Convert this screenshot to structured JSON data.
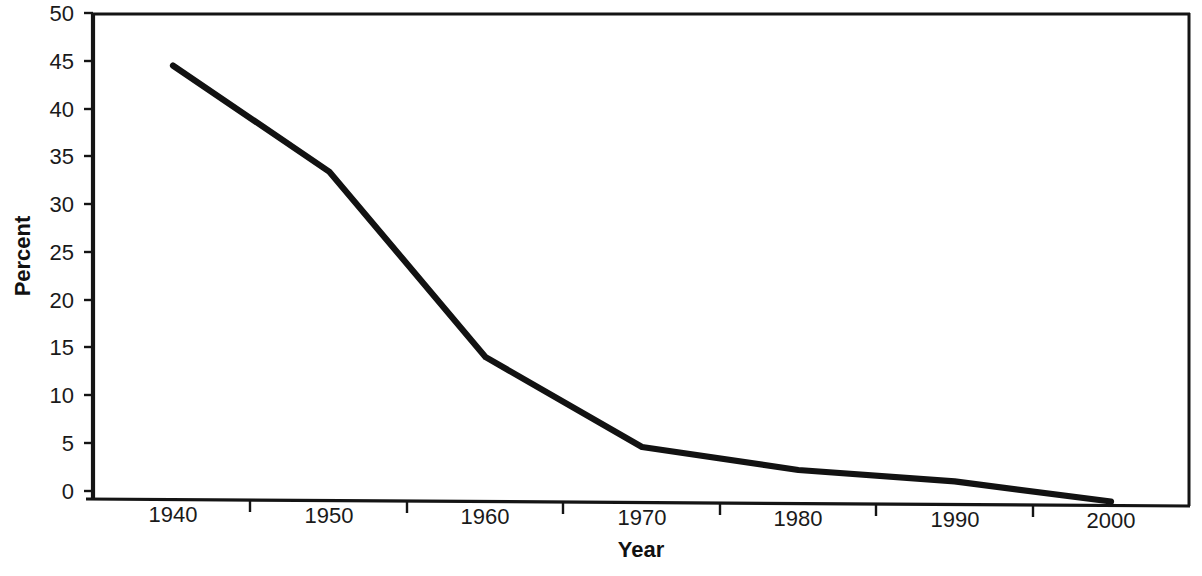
{
  "chart_data": {
    "type": "line",
    "title": "",
    "xlabel": "Year",
    "ylabel": "Percent",
    "x": [
      1940,
      1950,
      1960,
      1970,
      1980,
      1990,
      2000
    ],
    "values": [
      44.5,
      33.4,
      14.0,
      4.6,
      2.2,
      1.0,
      -1.1
    ],
    "series": [
      {
        "name": "Percent",
        "values": [
          44.5,
          33.4,
          14.0,
          4.6,
          2.2,
          1.0,
          -1.1
        ]
      }
    ],
    "xlim": [
      1935,
      2005
    ],
    "ylim": [
      0,
      50
    ],
    "x_tick_labels": [
      "1940",
      "1950",
      "1960",
      "1970",
      "1980",
      "1990",
      "2000"
    ],
    "y_tick_labels": [
      "0",
      "5",
      "10",
      "15",
      "20",
      "25",
      "30",
      "35",
      "40",
      "45",
      "50"
    ],
    "y_ticks": [
      0,
      5,
      10,
      15,
      20,
      25,
      30,
      35,
      40,
      45,
      50
    ],
    "x_tick_marks": [
      1945,
      1955,
      1965,
      1975,
      1985,
      1995
    ],
    "grid": false,
    "legend": "none",
    "line_color": "#121212",
    "axis_color": "#141414",
    "background_color": "#ffffff"
  },
  "axes": {
    "y_title": "Percent",
    "x_title": "Year",
    "y_labels": {
      "t50": "50",
      "t45": "45",
      "t40": "40",
      "t35": "35",
      "t30": "30",
      "t25": "25",
      "t20": "20",
      "t15": "15",
      "t10": "10",
      "t5": "5",
      "t0": "0"
    },
    "x_labels": {
      "y1940": "1940",
      "y1950": "1950",
      "y1960": "1960",
      "y1970": "1970",
      "y1980": "1980",
      "y1990": "1990",
      "y2000": "2000"
    }
  }
}
